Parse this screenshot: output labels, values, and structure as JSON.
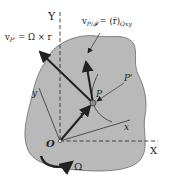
{
  "figure": {
    "type": "rigid-body-kinematics-diagram",
    "colors": {
      "background": "#ffffff",
      "body_fill": "#b9b9b9",
      "body_stroke": "#555555",
      "ink": "#222222",
      "point_fill": "#8a8a8a"
    },
    "labels": {
      "Y_axis": "Y",
      "X_axis": "X",
      "y_axis": "y",
      "x_axis": "x",
      "origin": "O",
      "point": "P",
      "point_prime": "P'",
      "position_vector": "r",
      "angular_velocity": "Ω",
      "v_transport_lhs": "v",
      "v_transport_sub": "P'",
      "v_transport_rhs": " = Ω × r",
      "v_relative_lhs": "v",
      "v_relative_sub": "P/𝓕",
      "v_relative_rhs": " = (ṙ)",
      "v_relative_rhs_sub": "Oxy"
    }
  }
}
